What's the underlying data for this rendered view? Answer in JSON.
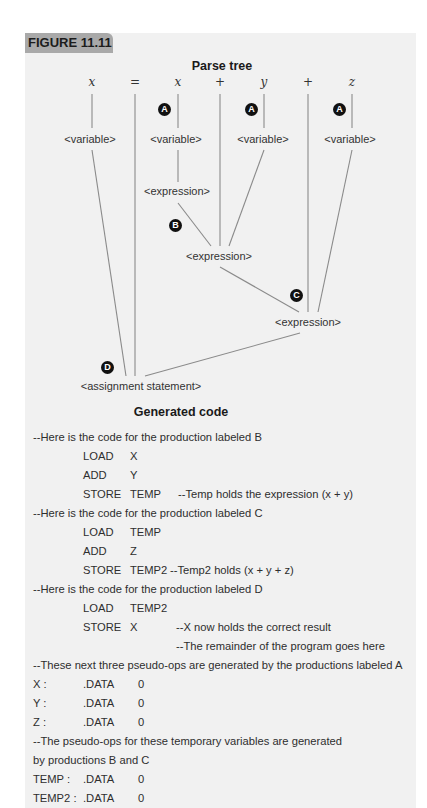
{
  "figure": {
    "label": "FIGURE 11.11",
    "tab_color": "#a9a9a9",
    "panel_color": "#f1f1f1"
  },
  "parse_tree": {
    "title": "Parse tree",
    "tokens": [
      "x",
      "=",
      "x",
      "+",
      "y",
      "+",
      "z"
    ],
    "variables": [
      "<variable>",
      "<variable>",
      "<variable>",
      "<variable>"
    ],
    "expressions": [
      "<expression>",
      "<expression>",
      "<expression>"
    ],
    "assignment": "<assignment statement>",
    "badges": {
      "a": "A",
      "b": "B",
      "c": "C",
      "d": "D"
    }
  },
  "generated_code": {
    "title": "Generated code",
    "comment_b": "--Here is the code for the production labeled B",
    "block_b": [
      {
        "op": "LOAD",
        "arg": "X",
        "note": ""
      },
      {
        "op": "ADD",
        "arg": "Y",
        "note": ""
      },
      {
        "op": "STORE",
        "arg": "TEMP",
        "note": "--Temp holds the expression (x + y)"
      }
    ],
    "comment_c": "--Here is the code for the production labeled C",
    "block_c": [
      {
        "op": "LOAD",
        "arg": "TEMP",
        "note": ""
      },
      {
        "op": "ADD",
        "arg": "Z",
        "note": ""
      },
      {
        "op": "STORE",
        "arg": "TEMP2",
        "note": "--Temp2 holds (x + y + z)"
      }
    ],
    "comment_d": "--Here is the code for the production labeled D",
    "block_d": [
      {
        "op": "LOAD",
        "arg": "TEMP2",
        "note": ""
      },
      {
        "op": "STORE",
        "arg": "X",
        "note": "--X now holds the correct result"
      },
      {
        "op": "",
        "arg": "",
        "note": "--The remainder of the program goes here"
      }
    ],
    "comment_a": "--These next three pseudo-ops are generated by the productions labeled A",
    "data_a": [
      {
        "label": "X :",
        "directive": ".DATA",
        "value": "0"
      },
      {
        "label": "Y :",
        "directive": ".DATA",
        "value": "0"
      },
      {
        "label": "Z :",
        "directive": ".DATA",
        "value": "0"
      }
    ],
    "comment_temp_1": "--The pseudo-ops for these temporary variables are generated",
    "comment_temp_2": "by productions B and C",
    "data_temp": [
      {
        "label": "TEMP :",
        "directive": ".DATA",
        "value": "0"
      },
      {
        "label": "TEMP2 :",
        "directive": ".DATA",
        "value": "0"
      }
    ]
  }
}
